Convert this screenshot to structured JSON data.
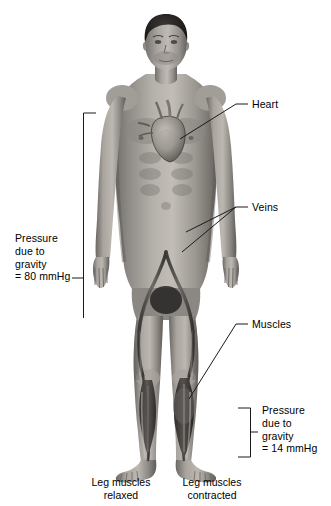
{
  "diagram": {
    "background_color": "#ffffff",
    "line_color": "#1a1a1a",
    "figure": {
      "subject": "human-male-body-anatomical-illustration",
      "style": "grayscale-airbrush",
      "skin_tone": "#9b9791",
      "hair_color": "#1d1b1a",
      "vein_color": "#55514e"
    },
    "callouts": [
      {
        "id": "heart",
        "label": "Heart"
      },
      {
        "id": "veins",
        "label": "Veins"
      },
      {
        "id": "muscles",
        "label": "Muscles"
      }
    ],
    "brackets": [
      {
        "id": "upper-body-pressure",
        "side": "left",
        "label": "Pressure\ndue to\ngravity\n= 80 mmHg",
        "value": "80",
        "unit": "mmHg"
      },
      {
        "id": "lower-leg-pressure",
        "side": "right",
        "label": "Pressure\ndue to\ngravity\n= 14 mmHg",
        "value": "14",
        "unit": "mmHg"
      }
    ],
    "captions": [
      {
        "id": "left-leg",
        "label": "Leg muscles\nrelaxed"
      },
      {
        "id": "right-leg",
        "label": "Leg muscles\ncontracted"
      }
    ]
  }
}
